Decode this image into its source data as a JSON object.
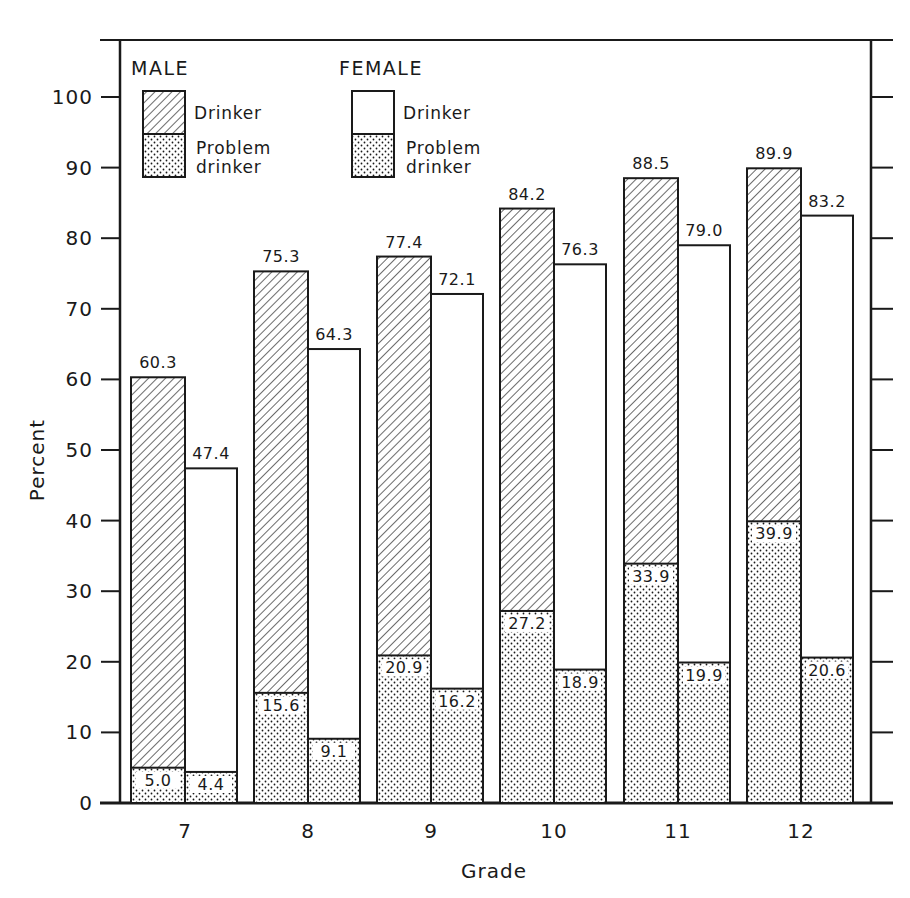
{
  "chart_data": {
    "type": "bar",
    "subtype": "grouped-overlaid",
    "title": "",
    "xlabel": "Grade",
    "ylabel": "Percent",
    "ylim": [
      0,
      100
    ],
    "yticks": [
      0,
      10,
      20,
      30,
      40,
      50,
      60,
      70,
      80,
      90,
      100
    ],
    "grid": false,
    "categories": [
      "7",
      "8",
      "9",
      "10",
      "11",
      "12"
    ],
    "legend": {
      "position": "top-left inside",
      "groups": [
        {
          "heading": "MALE",
          "entries": [
            {
              "label": "Drinker",
              "pattern": "diagonal-hatch"
            },
            {
              "label": "Problem drinker",
              "pattern": "dots"
            }
          ]
        },
        {
          "heading": "FEMALE",
          "entries": [
            {
              "label": "Drinker",
              "pattern": "white"
            },
            {
              "label": "Problem drinker",
              "pattern": "dots"
            }
          ]
        }
      ]
    },
    "series": [
      {
        "name": "Male Drinker",
        "values": [
          60.3,
          75.3,
          77.4,
          84.2,
          88.5,
          89.9
        ]
      },
      {
        "name": "Male Problem drinker",
        "values": [
          5.0,
          15.6,
          20.9,
          27.2,
          33.9,
          39.9
        ]
      },
      {
        "name": "Female Drinker",
        "values": [
          47.4,
          64.3,
          72.1,
          76.3,
          79.0,
          83.2
        ]
      },
      {
        "name": "Female Problem drinker",
        "values": [
          4.4,
          9.1,
          16.2,
          18.9,
          19.9,
          20.6
        ]
      }
    ]
  },
  "labels": {
    "male_drinker": [
      "60.3",
      "75.3",
      "77.4",
      "84.2",
      "88.5",
      "89.9"
    ],
    "male_problem": [
      "5.0",
      "15.6",
      "20.9",
      "27.2",
      "33.9",
      "39.9"
    ],
    "female_drinker": [
      "47.4",
      "64.3",
      "72.1",
      "76.3",
      "79.0",
      "83.2"
    ],
    "female_problem": [
      "4.4",
      "9.1",
      "16.2",
      "18.9",
      "19.9",
      "20.6"
    ],
    "yticks": [
      "0",
      "10",
      "20",
      "30",
      "40",
      "50",
      "60",
      "70",
      "80",
      "90",
      "100"
    ],
    "xticks": [
      "7",
      "8",
      "9",
      "10",
      "11",
      "12"
    ]
  },
  "legend": {
    "male_heading": "MALE",
    "female_heading": "FEMALE",
    "drinker": "Drinker",
    "problem_line1": "Problem",
    "problem_line2": "drinker"
  },
  "axes": {
    "xlabel": "Grade",
    "ylabel": "Percent"
  },
  "colors": {
    "ink": "#1a1a1a",
    "paper": "#ffffff"
  }
}
